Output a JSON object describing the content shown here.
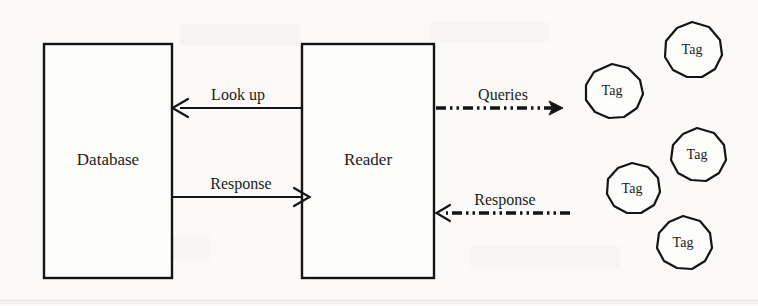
{
  "figure": {
    "type": "block-diagram",
    "background_color": "#fbfaf8",
    "ink_color": "#141414",
    "width": 758,
    "height": 306
  },
  "nodes": [
    {
      "id": "database",
      "label": "Database",
      "shape": "rectangle",
      "x": 44,
      "y": 44,
      "width": 128,
      "height": 234,
      "label_x": 108,
      "label_y": 161
    },
    {
      "id": "reader",
      "label": "Reader",
      "shape": "rectangle",
      "x": 302,
      "y": 44,
      "width": 132,
      "height": 234,
      "label_x": 368,
      "label_y": 161
    }
  ],
  "tags": [
    {
      "id": "tag-1",
      "label": "Tag",
      "cx": 612,
      "cy": 91,
      "r": 27
    },
    {
      "id": "tag-2",
      "label": "Tag",
      "cx": 692,
      "cy": 50,
      "r": 28
    },
    {
      "id": "tag-3",
      "label": "Tag",
      "cx": 632,
      "cy": 189,
      "r": 26
    },
    {
      "id": "tag-4",
      "label": "Tag",
      "cx": 697,
      "cy": 155,
      "r": 27
    },
    {
      "id": "tag-5",
      "label": "Tag",
      "cx": 683,
      "cy": 243,
      "r": 27
    }
  ],
  "edges": [
    {
      "id": "lookup",
      "label": "Look up",
      "style": "solid",
      "direction": "left",
      "from": "reader",
      "to": "database",
      "x1": 302,
      "x2": 173,
      "y": 108,
      "label_x": 238,
      "label_y": 100
    },
    {
      "id": "db-response",
      "label": "Response",
      "style": "solid",
      "direction": "right",
      "from": "database",
      "to": "reader",
      "x1": 173,
      "x2": 309,
      "y": 197,
      "label_x": 241,
      "label_y": 189
    },
    {
      "id": "queries",
      "label": "Queries",
      "style": "dash-dot-dot",
      "direction": "right",
      "from": "reader",
      "to": "tags",
      "x1": 436,
      "x2": 562,
      "y": 108,
      "label_x": 503,
      "label_y": 100
    },
    {
      "id": "tag-response",
      "label": "Response",
      "style": "dash-dot-dot",
      "direction": "left",
      "from": "tags",
      "to": "reader",
      "x1": 570,
      "x2": 436,
      "y": 213,
      "label_x": 505,
      "label_y": 205
    }
  ]
}
